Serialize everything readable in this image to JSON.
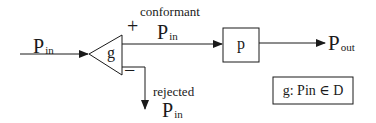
{
  "diagram": {
    "input": {
      "label_main": "P",
      "label_sub": "in"
    },
    "gate": {
      "label": "g",
      "plus_sign": "+",
      "minus_sign": "−"
    },
    "conformant": {
      "caption": "conformant",
      "label_main": "P",
      "label_sub": "in"
    },
    "rejected": {
      "caption": "rejected",
      "label_main": "P",
      "label_sub": "in"
    },
    "process_box": {
      "label": "p"
    },
    "output": {
      "label_main": "P",
      "label_sub": "out"
    },
    "legend": {
      "text": "g: Pin ∈ D"
    },
    "colors": {
      "stroke": "#1a1a1a",
      "background": "#ffffff"
    }
  }
}
